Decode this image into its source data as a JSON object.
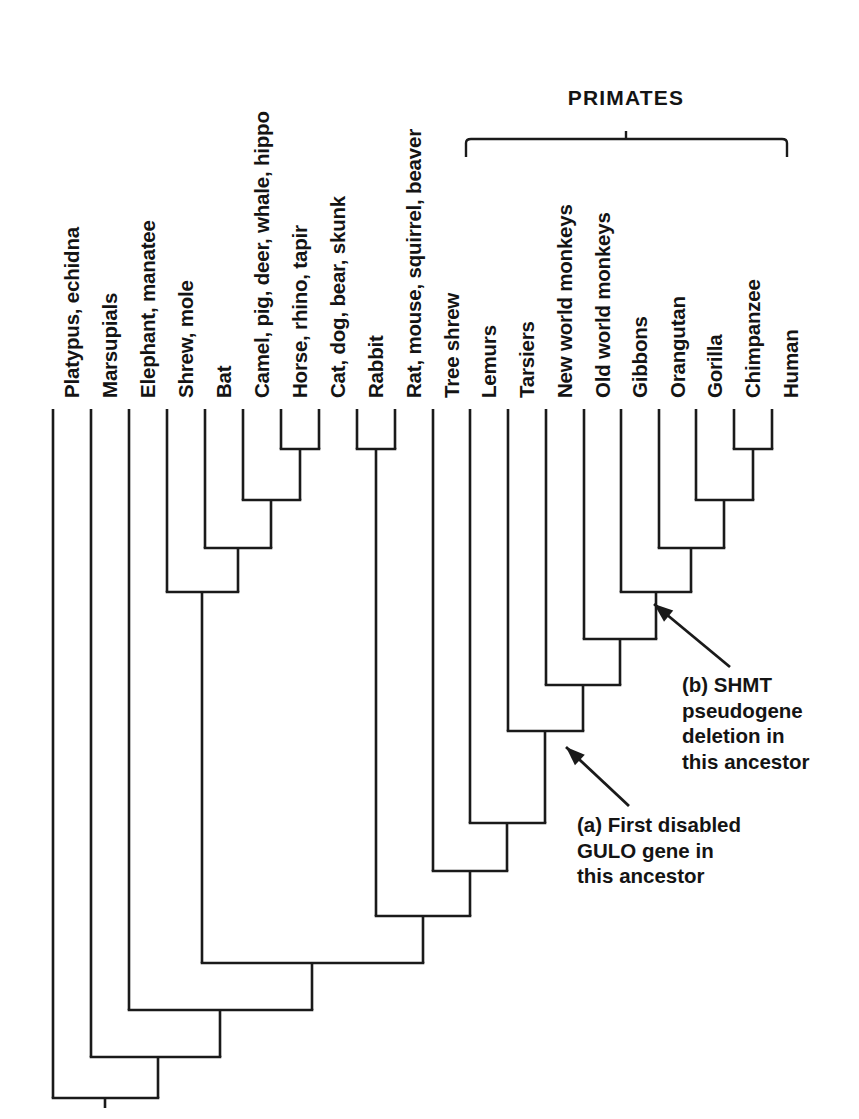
{
  "figure": {
    "kind": "cladogram",
    "background": "#ffffff",
    "line_color": "#1a1a1a",
    "text_color": "#141414"
  },
  "bracket": {
    "label": "PRIMATES",
    "x_start": 466,
    "x_end": 787,
    "y": 139,
    "tick_x": 626,
    "label_x": 626,
    "label_y": 110
  },
  "tips": [
    {
      "label": "Platypus, echidna",
      "x": 53,
      "y_top": 409
    },
    {
      "label": "Marsupials",
      "x": 91,
      "y_top": 409
    },
    {
      "label": "Elephant, manatee",
      "x": 129,
      "y_top": 409
    },
    {
      "label": "Shrew, mole",
      "x": 167,
      "y_top": 409
    },
    {
      "label": "Bat",
      "x": 205,
      "y_top": 409
    },
    {
      "label": "Camel, pig, deer, whale, hippo",
      "x": 243,
      "y_top": 409
    },
    {
      "label": "Horse, rhino, tapir",
      "x": 281,
      "y_top": 409
    },
    {
      "label": "Cat, dog, bear, skunk",
      "x": 319,
      "y_top": 409
    },
    {
      "label": "Rabbit",
      "x": 357,
      "y_top": 409
    },
    {
      "label": "Rat, mouse, squirrel, beaver",
      "x": 395,
      "y_top": 409
    },
    {
      "label": "Tree shrew",
      "x": 433,
      "y_top": 409
    },
    {
      "label": "Lemurs",
      "x": 470,
      "y_top": 409
    },
    {
      "label": "Tarsiers",
      "x": 508,
      "y_top": 409
    },
    {
      "label": "New world monkeys",
      "x": 546,
      "y_top": 409
    },
    {
      "label": "Old world monkeys",
      "x": 584,
      "y_top": 409
    },
    {
      "label": "Gibbons",
      "x": 621,
      "y_top": 409
    },
    {
      "label": "Orangutan",
      "x": 659,
      "y_top": 409
    },
    {
      "label": "Gorilla",
      "x": 696,
      "y_top": 409
    },
    {
      "label": "Chimpanzee",
      "x": 734,
      "y_top": 409
    },
    {
      "label": "Human",
      "x": 772,
      "y_top": 409
    }
  ],
  "tip_label_geometry": {
    "baseline_y": 398,
    "rotation_deg": -90,
    "text_offset_x": 7
  },
  "nodes": [
    {
      "name": "chimp-human",
      "y": 449,
      "left": 734,
      "right": 772,
      "stem_x": 753
    },
    {
      "name": "gorilla-clade",
      "y": 500,
      "left": 696,
      "right": 753,
      "stem_x": 724
    },
    {
      "name": "orangutan-clade",
      "y": 548,
      "left": 659,
      "right": 724,
      "stem_x": 691
    },
    {
      "name": "gibbon-clade",
      "y": 592,
      "left": 621,
      "right": 691,
      "stem_x": 656
    },
    {
      "name": "old-world-clade",
      "y": 639,
      "left": 584,
      "right": 656,
      "stem_x": 620
    },
    {
      "name": "new-world-clade",
      "y": 685,
      "left": 546,
      "right": 620,
      "stem_x": 583
    },
    {
      "name": "tarsier-clade",
      "y": 731,
      "left": 508,
      "right": 583,
      "stem_x": 545
    },
    {
      "name": "lemur-clade",
      "y": 823,
      "left": 470,
      "right": 545,
      "stem_x": 507
    },
    {
      "name": "treeshrew-clade",
      "y": 871,
      "left": 433,
      "right": 507,
      "stem_x": 470
    },
    {
      "name": "rabbit-rat",
      "y": 449,
      "left": 357,
      "right": 395,
      "stem_x": 376
    },
    {
      "name": "glires-primates",
      "y": 916,
      "left": 376,
      "right": 470,
      "stem_x": 423
    },
    {
      "name": "horse-cat",
      "y": 449,
      "left": 281,
      "right": 319,
      "stem_x": 300
    },
    {
      "name": "camel-clade",
      "y": 500,
      "left": 243,
      "right": 300,
      "stem_x": 271
    },
    {
      "name": "bat-clade",
      "y": 548,
      "left": 205,
      "right": 271,
      "stem_x": 238
    },
    {
      "name": "shrew-clade",
      "y": 592,
      "left": 167,
      "right": 238,
      "stem_x": 202
    },
    {
      "name": "laurasiatheria-euarchontoglires",
      "y": 963,
      "left": 202,
      "right": 423,
      "stem_x": 312
    },
    {
      "name": "elephant-clade",
      "y": 1010,
      "left": 129,
      "right": 312,
      "stem_x": 220
    },
    {
      "name": "marsupial-clade",
      "y": 1057,
      "left": 91,
      "right": 220,
      "stem_x": 158
    },
    {
      "name": "root",
      "y": 1098,
      "left": 53,
      "right": 158,
      "stem_x": 105
    }
  ],
  "root_stem": {
    "x": 105,
    "y_top": 1098,
    "y_bottom": 1108
  },
  "annotations": [
    {
      "id": "a",
      "text": "(a) First disabled\nGULO gene in\nthis ancestor",
      "text_x": 577,
      "text_y": 812,
      "arrow": {
        "tail_x": 629,
        "tail_y": 806,
        "tip_x": 566,
        "tip_y": 747
      }
    },
    {
      "id": "b",
      "text": "(b) SHMT\npseudogene\ndeletion in\nthis ancestor",
      "text_x": 682,
      "text_y": 672,
      "arrow": {
        "tail_x": 730,
        "tail_y": 667,
        "tip_x": 654,
        "tip_y": 604
      }
    }
  ]
}
